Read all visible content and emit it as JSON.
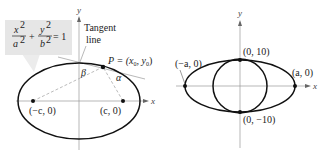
{
  "figures": [
    {
      "id": "left",
      "equation": {
        "num1": "x",
        "den1": "a",
        "num2": "y",
        "den2": "b",
        "exp": "2",
        "plus": "+",
        "equals": "= 1"
      },
      "axis_labels": {
        "x": "x",
        "y": "y"
      },
      "tangent_label_line1": "Tangent",
      "tangent_label_line2": "line",
      "point_label": "P = (x",
      "point_sub0": "0",
      "point_mid": ", y",
      "point_sub1": "0",
      "point_close": ")",
      "angle_beta": "β",
      "angle_alpha": "α",
      "focus_left": "(−c, 0)",
      "focus_right": "(c, 0)"
    },
    {
      "id": "right",
      "axis_labels": {
        "x": "x",
        "y": "y"
      },
      "vertex_left": "(−a, 0)",
      "vertex_right": "(a, 0)",
      "top_point": "(0, 10)",
      "bottom_point": "(0, −10)"
    }
  ],
  "colors": {
    "curve": "#111111",
    "axis": "#888888",
    "dashed": "#aaaaaa",
    "equation_box": "#e6e6e6",
    "tangent": "#b0b0b0"
  }
}
